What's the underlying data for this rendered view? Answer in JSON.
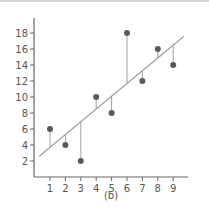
{
  "chart_data": {
    "type": "scatter",
    "title": "",
    "caption": "(b)",
    "xlabel": "",
    "ylabel": "",
    "x": [
      1,
      2,
      3,
      4,
      5,
      6,
      7,
      8,
      9
    ],
    "series": [
      {
        "name": "observed",
        "values": [
          6,
          4,
          2,
          10,
          8,
          18,
          12,
          16,
          14
        ]
      }
    ],
    "fit_line": {
      "x_start": 0.3,
      "y_start": 2.6,
      "x_end": 9.7,
      "y_end": 17.6
    },
    "residuals_shown": true,
    "x_ticks": [
      1,
      2,
      3,
      4,
      5,
      6,
      7,
      8,
      9
    ],
    "y_ticks": [
      2,
      4,
      6,
      8,
      10,
      12,
      14,
      16,
      18
    ],
    "xlim": [
      0,
      10
    ],
    "ylim": [
      0,
      20
    ],
    "grid": false,
    "legend": "none",
    "colors": {
      "points": "#5a5a5a",
      "fit_line": "#a0a0a0",
      "residual": "#a0a0a0",
      "axis": "#666666",
      "text": "#555555"
    }
  }
}
